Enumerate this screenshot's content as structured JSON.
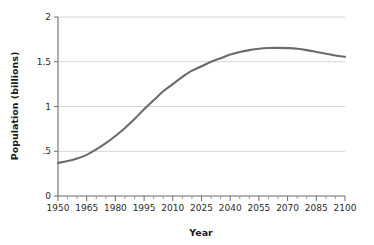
{
  "chart_data": {
    "type": "line",
    "title": "",
    "xlabel": "Year",
    "ylabel": "Population (billions)",
    "xlim": [
      1950,
      2100
    ],
    "ylim": [
      0,
      2
    ],
    "grid": true,
    "legend": false,
    "line_color": "#6b6b6b",
    "x_ticks": [
      1950,
      1965,
      1980,
      1995,
      2010,
      2025,
      2040,
      2055,
      2070,
      2085,
      2100
    ],
    "x_tick_labels": [
      "1950",
      "1965",
      "1980",
      "1995",
      "2010",
      "2025",
      "2040",
      "2055",
      "2070",
      "2085",
      "2100"
    ],
    "x_minor_tick_step": 5,
    "y_ticks": [
      0,
      0.5,
      1,
      1.5,
      2
    ],
    "y_tick_labels": [
      "0",
      ".5",
      "1",
      "1.5",
      "2"
    ],
    "series": [
      {
        "name": "Population",
        "x": [
          1950,
          1955,
          1960,
          1965,
          1970,
          1975,
          1980,
          1985,
          1990,
          1995,
          2000,
          2005,
          2010,
          2015,
          2020,
          2025,
          2030,
          2035,
          2040,
          2045,
          2050,
          2055,
          2060,
          2065,
          2070,
          2075,
          2080,
          2085,
          2090,
          2095,
          2100
        ],
        "values": [
          0.37,
          0.39,
          0.42,
          0.46,
          0.52,
          0.59,
          0.67,
          0.76,
          0.86,
          0.97,
          1.07,
          1.17,
          1.25,
          1.33,
          1.4,
          1.45,
          1.5,
          1.54,
          1.58,
          1.61,
          1.63,
          1.645,
          1.653,
          1.655,
          1.652,
          1.645,
          1.63,
          1.61,
          1.59,
          1.57,
          1.555
        ]
      }
    ]
  }
}
